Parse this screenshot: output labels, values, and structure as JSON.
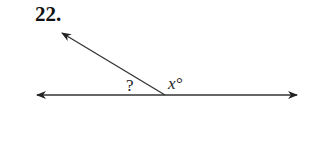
{
  "problem": {
    "number": "22.",
    "labels": {
      "unknown_angle": "?",
      "given_angle": "x°"
    }
  },
  "colors": {
    "line": "#333333",
    "text": "#111111"
  }
}
